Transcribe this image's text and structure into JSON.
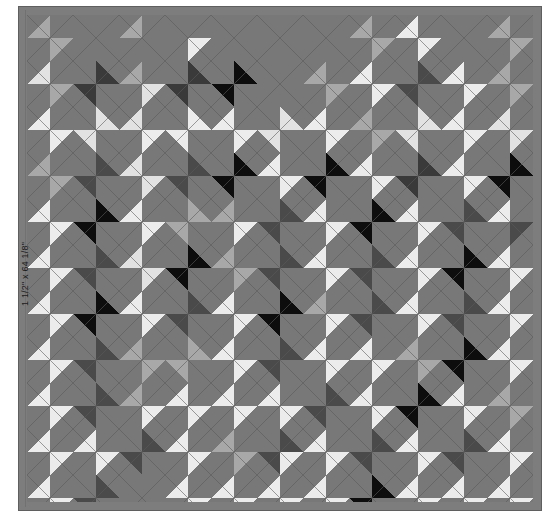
{
  "canvas": {
    "width": 551,
    "height": 521,
    "page_background": "#ffffff"
  },
  "annotation": {
    "border_dimension_label": "1 1/2\" x 64 1/8\"",
    "label_rotation_deg": -90
  },
  "quilt": {
    "title": "On-point argyle quilt layout",
    "frame": {
      "x": 18,
      "y": 6,
      "width": 524,
      "height": 505
    },
    "border": {
      "name": "outer-border",
      "width_px": 9,
      "color": "#7d7d7d",
      "seam_color": "#5f5f5f",
      "seam_width_px": 1
    },
    "body": {
      "x": 27,
      "y": 15,
      "width": 506,
      "height": 487
    },
    "grid": {
      "pitch_px": 46,
      "columns": 11,
      "rows": 11,
      "half_drop": true,
      "seam_color": "#5a5a5a",
      "seam_width_px": 0.9,
      "background_color": "#787878"
    },
    "palette": {
      "bg": "#787878",
      "black": "#0d0d0d",
      "white": "#ececec",
      "cream": "#e2e2e2",
      "light": "#a8a8a8",
      "mid": "#8d8d8d",
      "dark": "#4a4a4a",
      "charcoal": "#3a3a3a"
    },
    "palette_legend": [
      {
        "key": "black",
        "label": "Black",
        "hex": "#0d0d0d"
      },
      {
        "key": "white",
        "label": "White",
        "hex": "#ececec"
      },
      {
        "key": "cream",
        "label": "Cream",
        "hex": "#e2e2e2"
      },
      {
        "key": "light",
        "label": "Light Gray",
        "hex": "#a8a8a8"
      },
      {
        "key": "mid",
        "label": "Medium Gray",
        "hex": "#8d8d8d"
      },
      {
        "key": "dark",
        "label": "Dark Gray",
        "hex": "#4a4a4a"
      },
      {
        "key": "charcoal",
        "label": "Charcoal",
        "hex": "#3a3a3a"
      },
      {
        "key": "bg",
        "label": "Background",
        "hex": "#787878"
      }
    ],
    "blocks": [
      {
        "r": 0,
        "c": 0,
        "n": "bg",
        "e": "light",
        "s": "bg",
        "w": "light"
      },
      {
        "r": 0,
        "c": 1,
        "n": "bg",
        "e": "bg",
        "s": "bg",
        "w": "bg"
      },
      {
        "r": 0,
        "c": 2,
        "n": "bg",
        "e": "bg",
        "s": "bg",
        "w": "light"
      },
      {
        "r": 0,
        "c": 3,
        "n": "bg",
        "e": "white",
        "s": "bg",
        "w": "bg"
      },
      {
        "r": 0,
        "c": 4,
        "n": "bg",
        "e": "bg",
        "s": "bg",
        "w": "bg"
      },
      {
        "r": 0,
        "c": 5,
        "n": "bg",
        "e": "bg",
        "s": "bg",
        "w": "bg"
      },
      {
        "r": 0,
        "c": 6,
        "n": "bg",
        "e": "bg",
        "s": "bg",
        "w": "bg"
      },
      {
        "r": 0,
        "c": 7,
        "n": "bg",
        "e": "light",
        "s": "bg",
        "w": "light"
      },
      {
        "r": 0,
        "c": 8,
        "n": "bg",
        "e": "white",
        "s": "bg",
        "w": "white"
      },
      {
        "r": 0,
        "c": 9,
        "n": "bg",
        "e": "bg",
        "s": "bg",
        "w": "bg"
      },
      {
        "r": 0,
        "c": 10,
        "n": "bg",
        "e": "light",
        "s": "bg",
        "w": "light"
      },
      {
        "r": 1,
        "c": 0,
        "n": "bg",
        "e": "light",
        "s": "bg",
        "w": "cream"
      },
      {
        "r": 1,
        "c": 1,
        "n": "charcoal",
        "e": "bg",
        "s": "charcoal",
        "w": "bg"
      },
      {
        "r": 1,
        "c": 2,
        "n": "bg",
        "e": "cream",
        "s": "bg",
        "w": "light"
      },
      {
        "r": 1,
        "c": 3,
        "n": "charcoal",
        "e": "bg",
        "s": "charcoal",
        "w": "bg"
      },
      {
        "r": 1,
        "c": 4,
        "n": "black",
        "e": "bg",
        "s": "black",
        "w": "bg"
      },
      {
        "r": 1,
        "c": 5,
        "n": "bg",
        "e": "bg",
        "s": "bg",
        "w": "bg"
      },
      {
        "r": 1,
        "c": 6,
        "n": "bg",
        "e": "light",
        "s": "bg",
        "w": "light"
      },
      {
        "r": 1,
        "c": 7,
        "n": "bg",
        "e": "white",
        "s": "bg",
        "w": "white"
      },
      {
        "r": 1,
        "c": 8,
        "n": "dark",
        "e": "bg",
        "s": "dark",
        "w": "bg"
      },
      {
        "r": 1,
        "c": 9,
        "n": "bg",
        "e": "white",
        "s": "bg",
        "w": "white"
      },
      {
        "r": 1,
        "c": 10,
        "n": "bg",
        "e": "light",
        "s": "bg",
        "w": "light"
      },
      {
        "r": 2,
        "c": 0,
        "n": "bg",
        "e": "white",
        "s": "bg",
        "w": "white"
      },
      {
        "r": 2,
        "c": 1,
        "n": "cream",
        "e": "bg",
        "s": "cream",
        "w": "bg"
      },
      {
        "r": 2,
        "c": 2,
        "n": "bg",
        "e": "white",
        "s": "bg",
        "w": "cream"
      },
      {
        "r": 2,
        "c": 3,
        "n": "white",
        "e": "bg",
        "s": "white",
        "w": "bg"
      },
      {
        "r": 2,
        "c": 4,
        "n": "bg",
        "e": "white",
        "s": "bg",
        "w": "white"
      },
      {
        "r": 2,
        "c": 5,
        "n": "cream",
        "e": "bg",
        "s": "cream",
        "w": "bg"
      },
      {
        "r": 2,
        "c": 6,
        "n": "bg",
        "e": "white",
        "s": "bg",
        "w": "white"
      },
      {
        "r": 2,
        "c": 7,
        "n": "bg",
        "e": "light",
        "s": "bg",
        "w": "light"
      },
      {
        "r": 2,
        "c": 8,
        "n": "cream",
        "e": "bg",
        "s": "cream",
        "w": "bg"
      },
      {
        "r": 2,
        "c": 9,
        "n": "bg",
        "e": "white",
        "s": "bg",
        "w": "white"
      },
      {
        "r": 2,
        "c": 10,
        "n": "bg",
        "e": "cream",
        "s": "bg",
        "w": "cream"
      },
      {
        "r": 3,
        "c": 0,
        "n": "bg",
        "e": "light",
        "s": "bg",
        "w": "light"
      },
      {
        "r": 3,
        "c": 1,
        "n": "dark",
        "e": "bg",
        "s": "dark",
        "w": "bg"
      },
      {
        "r": 3,
        "c": 2,
        "n": "bg",
        "e": "cream",
        "s": "bg",
        "w": "cream"
      },
      {
        "r": 3,
        "c": 3,
        "n": "dark",
        "e": "bg",
        "s": "dark",
        "w": "bg"
      },
      {
        "r": 3,
        "c": 4,
        "n": "black",
        "e": "bg",
        "s": "black",
        "w": "bg"
      },
      {
        "r": 3,
        "c": 5,
        "n": "bg",
        "e": "white",
        "s": "bg",
        "w": "white"
      },
      {
        "r": 3,
        "c": 6,
        "n": "black",
        "e": "bg",
        "s": "black",
        "w": "bg"
      },
      {
        "r": 3,
        "c": 7,
        "n": "bg",
        "e": "white",
        "s": "bg",
        "w": "white"
      },
      {
        "r": 3,
        "c": 8,
        "n": "charcoal",
        "e": "bg",
        "s": "charcoal",
        "w": "bg"
      },
      {
        "r": 3,
        "c": 9,
        "n": "bg",
        "e": "white",
        "s": "bg",
        "w": "white"
      },
      {
        "r": 3,
        "c": 10,
        "n": "black",
        "e": "bg",
        "s": "black",
        "w": "bg"
      },
      {
        "r": 4,
        "c": 0,
        "n": "bg",
        "e": "white",
        "s": "bg",
        "w": "white"
      },
      {
        "r": 4,
        "c": 1,
        "n": "black",
        "e": "bg",
        "s": "black",
        "w": "bg"
      },
      {
        "r": 4,
        "c": 2,
        "n": "bg",
        "e": "white",
        "s": "bg",
        "w": "white"
      },
      {
        "r": 4,
        "c": 3,
        "n": "light",
        "e": "bg",
        "s": "light",
        "w": "bg"
      },
      {
        "r": 4,
        "c": 4,
        "n": "bg",
        "e": "white",
        "s": "bg",
        "w": "light"
      },
      {
        "r": 4,
        "c": 5,
        "n": "dark",
        "e": "bg",
        "s": "dark",
        "w": "bg"
      },
      {
        "r": 4,
        "c": 6,
        "n": "bg",
        "e": "white",
        "s": "bg",
        "w": "white"
      },
      {
        "r": 4,
        "c": 7,
        "n": "black",
        "e": "bg",
        "s": "black",
        "w": "bg"
      },
      {
        "r": 4,
        "c": 8,
        "n": "bg",
        "e": "white",
        "s": "bg",
        "w": "white"
      },
      {
        "r": 4,
        "c": 9,
        "n": "dark",
        "e": "bg",
        "s": "dark",
        "w": "bg"
      },
      {
        "r": 4,
        "c": 10,
        "n": "bg",
        "e": "dark",
        "s": "bg",
        "w": "white"
      },
      {
        "r": 5,
        "c": 0,
        "n": "bg",
        "e": "white",
        "s": "bg",
        "w": "white"
      },
      {
        "r": 5,
        "c": 1,
        "n": "dark",
        "e": "bg",
        "s": "dark",
        "w": "bg"
      },
      {
        "r": 5,
        "c": 2,
        "n": "bg",
        "e": "cream",
        "s": "bg",
        "w": "cream"
      },
      {
        "r": 5,
        "c": 3,
        "n": "black",
        "e": "bg",
        "s": "black",
        "w": "bg"
      },
      {
        "r": 5,
        "c": 4,
        "n": "bg",
        "e": "light",
        "s": "bg",
        "w": "light"
      },
      {
        "r": 5,
        "c": 5,
        "n": "dark",
        "e": "bg",
        "s": "dark",
        "w": "bg"
      },
      {
        "r": 5,
        "c": 6,
        "n": "bg",
        "e": "white",
        "s": "bg",
        "w": "white"
      },
      {
        "r": 5,
        "c": 7,
        "n": "dark",
        "e": "bg",
        "s": "dark",
        "w": "bg"
      },
      {
        "r": 5,
        "c": 8,
        "n": "bg",
        "e": "white",
        "s": "bg",
        "w": "white"
      },
      {
        "r": 5,
        "c": 9,
        "n": "black",
        "e": "bg",
        "s": "black",
        "w": "bg"
      },
      {
        "r": 5,
        "c": 10,
        "n": "bg",
        "e": "white",
        "s": "bg",
        "w": "white"
      },
      {
        "r": 6,
        "c": 0,
        "n": "bg",
        "e": "white",
        "s": "bg",
        "w": "white"
      },
      {
        "r": 6,
        "c": 1,
        "n": "black",
        "e": "bg",
        "s": "black",
        "w": "bg"
      },
      {
        "r": 6,
        "c": 2,
        "n": "bg",
        "e": "white",
        "s": "bg",
        "w": "white"
      },
      {
        "r": 6,
        "c": 3,
        "n": "dark",
        "e": "bg",
        "s": "dark",
        "w": "bg"
      },
      {
        "r": 6,
        "c": 4,
        "n": "bg",
        "e": "white",
        "s": "bg",
        "w": "white"
      },
      {
        "r": 6,
        "c": 5,
        "n": "black",
        "e": "bg",
        "s": "black",
        "w": "bg"
      },
      {
        "r": 6,
        "c": 6,
        "n": "bg",
        "e": "white",
        "s": "bg",
        "w": "light"
      },
      {
        "r": 6,
        "c": 7,
        "n": "dark",
        "e": "bg",
        "s": "dark",
        "w": "bg"
      },
      {
        "r": 6,
        "c": 8,
        "n": "bg",
        "e": "white",
        "s": "bg",
        "w": "white"
      },
      {
        "r": 6,
        "c": 9,
        "n": "dark",
        "e": "bg",
        "s": "dark",
        "w": "bg"
      },
      {
        "r": 6,
        "c": 10,
        "n": "bg",
        "e": "white",
        "s": "bg",
        "w": "white"
      },
      {
        "r": 7,
        "c": 0,
        "n": "bg",
        "e": "white",
        "s": "bg",
        "w": "white"
      },
      {
        "r": 7,
        "c": 1,
        "n": "dark",
        "e": "bg",
        "s": "dark",
        "w": "bg"
      },
      {
        "r": 7,
        "c": 2,
        "n": "bg",
        "e": "light",
        "s": "bg",
        "w": "light"
      },
      {
        "r": 7,
        "c": 3,
        "n": "light",
        "e": "bg",
        "s": "light",
        "w": "bg"
      },
      {
        "r": 7,
        "c": 4,
        "n": "bg",
        "e": "white",
        "s": "bg",
        "w": "white"
      },
      {
        "r": 7,
        "c": 5,
        "n": "dark",
        "e": "bg",
        "s": "dark",
        "w": "bg"
      },
      {
        "r": 7,
        "c": 6,
        "n": "bg",
        "e": "white",
        "s": "bg",
        "w": "white"
      },
      {
        "r": 7,
        "c": 7,
        "n": "bg",
        "e": "white",
        "s": "bg",
        "w": "white"
      },
      {
        "r": 7,
        "c": 8,
        "n": "bg",
        "e": "light",
        "s": "bg",
        "w": "light"
      },
      {
        "r": 7,
        "c": 9,
        "n": "black",
        "e": "bg",
        "s": "black",
        "w": "bg"
      },
      {
        "r": 7,
        "c": 10,
        "n": "bg",
        "e": "white",
        "s": "bg",
        "w": "white"
      },
      {
        "r": 8,
        "c": 0,
        "n": "bg",
        "e": "white",
        "s": "bg",
        "w": "white"
      },
      {
        "r": 8,
        "c": 1,
        "n": "dark",
        "e": "bg",
        "s": "dark",
        "w": "bg"
      },
      {
        "r": 8,
        "c": 2,
        "n": "bg",
        "e": "white",
        "s": "bg",
        "w": "light"
      },
      {
        "r": 8,
        "c": 3,
        "n": "bg",
        "e": "white",
        "s": "bg",
        "w": "white"
      },
      {
        "r": 8,
        "c": 4,
        "n": "bg",
        "e": "white",
        "s": "bg",
        "w": "white"
      },
      {
        "r": 8,
        "c": 5,
        "n": "bg",
        "e": "white",
        "s": "bg",
        "w": "white"
      },
      {
        "r": 8,
        "c": 6,
        "n": "dark",
        "e": "bg",
        "s": "dark",
        "w": "bg"
      },
      {
        "r": 8,
        "c": 7,
        "n": "bg",
        "e": "white",
        "s": "bg",
        "w": "white"
      },
      {
        "r": 8,
        "c": 8,
        "n": "black",
        "e": "bg",
        "s": "black",
        "w": "bg"
      },
      {
        "r": 8,
        "c": 9,
        "n": "bg",
        "e": "white",
        "s": "bg",
        "w": "white"
      },
      {
        "r": 8,
        "c": 10,
        "n": "bg",
        "e": "light",
        "s": "bg",
        "w": "light"
      },
      {
        "r": 9,
        "c": 0,
        "n": "bg",
        "e": "white",
        "s": "bg",
        "w": "white"
      },
      {
        "r": 9,
        "c": 1,
        "n": "bg",
        "e": "white",
        "s": "bg",
        "w": "white"
      },
      {
        "r": 9,
        "c": 2,
        "n": "dark",
        "e": "bg",
        "s": "dark",
        "w": "bg"
      },
      {
        "r": 9,
        "c": 3,
        "n": "bg",
        "e": "white",
        "s": "bg",
        "w": "white"
      },
      {
        "r": 9,
        "c": 4,
        "n": "bg",
        "e": "light",
        "s": "bg",
        "w": "light"
      },
      {
        "r": 9,
        "c": 5,
        "n": "dark",
        "e": "white",
        "s": "dark",
        "w": "bg"
      },
      {
        "r": 9,
        "c": 6,
        "n": "bg",
        "e": "white",
        "s": "bg",
        "w": "white"
      },
      {
        "r": 9,
        "c": 7,
        "n": "dark",
        "e": "bg",
        "s": "dark",
        "w": "bg"
      },
      {
        "r": 9,
        "c": 8,
        "n": "bg",
        "e": "white",
        "s": "bg",
        "w": "white"
      },
      {
        "r": 9,
        "c": 9,
        "n": "dark",
        "e": "bg",
        "s": "dark",
        "w": "bg"
      },
      {
        "r": 9,
        "c": 10,
        "n": "bg",
        "e": "white",
        "s": "bg",
        "w": "white"
      },
      {
        "r": 10,
        "c": 0,
        "n": "bg",
        "e": "white",
        "s": "bg",
        "w": "white"
      },
      {
        "r": 10,
        "c": 1,
        "n": "dark",
        "e": "bg",
        "s": "dark",
        "w": "bg"
      },
      {
        "r": 10,
        "c": 2,
        "n": "bg",
        "e": "bg",
        "s": "bg",
        "w": "bg"
      },
      {
        "r": 10,
        "c": 3,
        "n": "bg",
        "e": "white",
        "s": "bg",
        "w": "white"
      },
      {
        "r": 10,
        "c": 4,
        "n": "bg",
        "e": "white",
        "s": "bg",
        "w": "white"
      },
      {
        "r": 10,
        "c": 5,
        "n": "bg",
        "e": "white",
        "s": "bg",
        "w": "white"
      },
      {
        "r": 10,
        "c": 6,
        "n": "bg",
        "e": "white",
        "s": "bg",
        "w": "white"
      },
      {
        "r": 10,
        "c": 7,
        "n": "black",
        "e": "bg",
        "s": "black",
        "w": "bg"
      },
      {
        "r": 10,
        "c": 8,
        "n": "bg",
        "e": "white",
        "s": "bg",
        "w": "white"
      },
      {
        "r": 10,
        "c": 9,
        "n": "bg",
        "e": "white",
        "s": "bg",
        "w": "white"
      },
      {
        "r": 10,
        "c": 10,
        "n": "bg",
        "e": "white",
        "s": "bg",
        "w": "white"
      }
    ]
  }
}
